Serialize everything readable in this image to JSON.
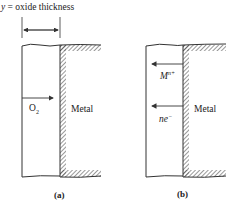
{
  "title_label": {
    "var": "y",
    "text": " = oxide thickness"
  },
  "panel_a": {
    "caption": "(a)",
    "species_label": "O",
    "species_sub": "2",
    "metal_label": "Metal"
  },
  "panel_b": {
    "caption": "(b)",
    "ion_label": "M",
    "ion_sup": "n+",
    "electron_label": "ne",
    "electron_sup": "−",
    "metal_label": "Metal"
  }
}
